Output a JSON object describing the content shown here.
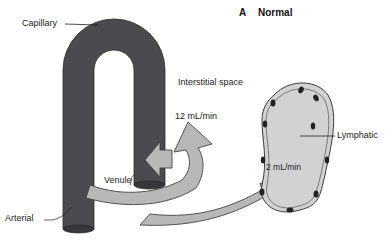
{
  "panel": {
    "letter": "A",
    "title": "Normal"
  },
  "labels": {
    "capillary": "Capillary",
    "interstitial": "Interstitial space",
    "filtration_rate": "12 mL/min",
    "lymph_rate": "2 mL/min",
    "lymphatic": "Lymphatic",
    "venule": "Venule",
    "arterial": "Arterial"
  },
  "colors": {
    "vessel": "#4a4a4f",
    "vessel_end": "#38383c",
    "arrow_fill": "#b8b8b8",
    "lymph_fill": "#d2d2d2",
    "nucleus": "#222222"
  }
}
